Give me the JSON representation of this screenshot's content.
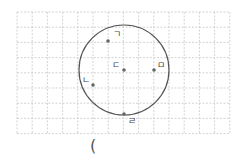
{
  "figure": {
    "grid": {
      "x0": 17,
      "y0": 12,
      "cols": 14,
      "rows": 8,
      "cell": 15.2,
      "line_color": "#c8c8c8"
    },
    "circle": {
      "cx": 124,
      "cy": 70,
      "r": 45,
      "stroke": "#555555"
    },
    "points": [
      {
        "label": "ㄱ",
        "x": 108,
        "y": 41,
        "lx": 113,
        "ly": 37
      },
      {
        "label": "ㄴ",
        "x": 93,
        "y": 85,
        "lx": 82,
        "ly": 83
      },
      {
        "label": "ㄷ",
        "x": 124,
        "y": 70,
        "lx": 112,
        "ly": 68
      },
      {
        "label": "ㄹ",
        "x": 124,
        "y": 114,
        "lx": 128,
        "ly": 124
      },
      {
        "label": "ㅁ",
        "x": 154,
        "y": 70,
        "lx": 157,
        "ly": 68
      }
    ]
  },
  "answer_blank": "("
}
